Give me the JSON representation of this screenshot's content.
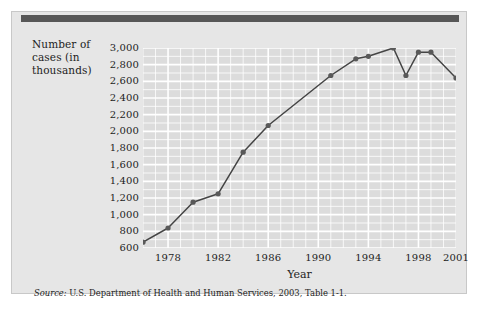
{
  "figure": {
    "y_axis_title_lines": [
      "Number of",
      "cases (in",
      "thousands)"
    ],
    "x_axis_title": "Year",
    "source_label": "Source:",
    "source_text": " U.S. Department of Health and Human Services, 2003, Table 1-1.",
    "colors": {
      "panel_background": "#e6e6e6",
      "header_bar": "#575757",
      "plot_background": "#dcdcdc",
      "gridline": "#ffffff",
      "line": "#444444",
      "marker": "#595959",
      "text": "#1d1d1d"
    }
  },
  "chart_data": {
    "type": "line",
    "title": "",
    "xlabel": "Year",
    "ylabel": "Number of cases (in thousands)",
    "xlim": [
      1976,
      2001
    ],
    "ylim": [
      600,
      3000
    ],
    "ytick_step": 200,
    "grid": true,
    "minor_grid": true,
    "legend": false,
    "ytick_labels": [
      "3,000",
      "2,800",
      "2,600",
      "2,400",
      "2,200",
      "2,000",
      "1,800",
      "1,600",
      "1,400",
      "1,200",
      "1,000",
      "800",
      "600"
    ],
    "ytick_values": [
      3000,
      2800,
      2600,
      2400,
      2200,
      2000,
      1800,
      1600,
      1400,
      1200,
      1000,
      800,
      600
    ],
    "xtick_labels": [
      "1978",
      "1982",
      "1986",
      "1990",
      "1994",
      "1998",
      "2001"
    ],
    "xtick_values": [
      1978,
      1982,
      1986,
      1990,
      1994,
      1998,
      2001
    ],
    "x": [
      1976,
      1978,
      1980,
      1982,
      1984,
      1986,
      1991,
      1993,
      1994,
      1996,
      1997,
      1998,
      1999,
      2001
    ],
    "values": [
      670,
      840,
      1150,
      1250,
      1750,
      2070,
      2670,
      2870,
      2900,
      3000,
      2670,
      2950,
      2950,
      2640
    ],
    "series": [
      {
        "name": "Number of cases (in thousands)",
        "points": [
          {
            "x": 1976,
            "y": 670
          },
          {
            "x": 1978,
            "y": 840
          },
          {
            "x": 1980,
            "y": 1150
          },
          {
            "x": 1982,
            "y": 1250
          },
          {
            "x": 1984,
            "y": 1750
          },
          {
            "x": 1986,
            "y": 2070
          },
          {
            "x": 1991,
            "y": 2670
          },
          {
            "x": 1993,
            "y": 2870
          },
          {
            "x": 1994,
            "y": 2900
          },
          {
            "x": 1996,
            "y": 3000
          },
          {
            "x": 1997,
            "y": 2670
          },
          {
            "x": 1998,
            "y": 2950
          },
          {
            "x": 1999,
            "y": 2950
          },
          {
            "x": 2001,
            "y": 2640
          }
        ]
      }
    ]
  }
}
